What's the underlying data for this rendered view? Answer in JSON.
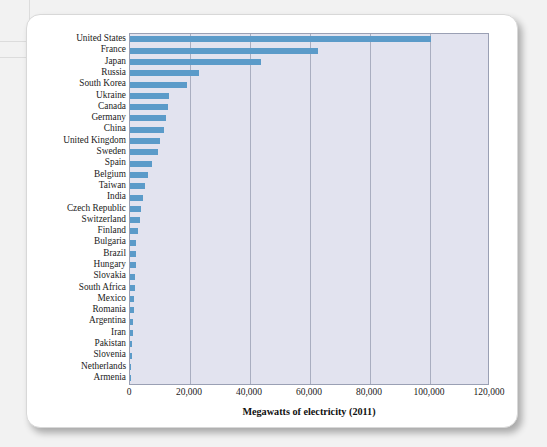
{
  "figure": {
    "background_color": "#f2f2f2",
    "card_color": "#ffffff",
    "plot_background": "#e2e3ef",
    "bar_color": "#5b9bc9",
    "gridline_color": "#a9aec0"
  },
  "chart_data": {
    "type": "bar",
    "orientation": "horizontal",
    "title": "",
    "subtitle": "",
    "xlabel": "Megawatts of electricity (2011)",
    "ylabel": "",
    "xlim": [
      0,
      120000
    ],
    "xticks": [
      0,
      20000,
      40000,
      60000,
      80000,
      100000,
      120000
    ],
    "xtick_labels": [
      "0",
      "20,000",
      "40,000",
      "60,000",
      "80,000",
      "100,000",
      "120,000"
    ],
    "grid": true,
    "grid_axis": "x",
    "legend": null,
    "legend_position": "none",
    "categories": [
      "United States",
      "France",
      "Japan",
      "Russia",
      "South Korea",
      "Ukraine",
      "Canada",
      "Germany",
      "China",
      "United Kingdom",
      "Sweden",
      "Spain",
      "Belgium",
      "Taiwan",
      "India",
      "Czech Republic",
      "Switzerland",
      "Finland",
      "Bulgaria",
      "Brazil",
      "Hungary",
      "Slovakia",
      "South Africa",
      "Mexico",
      "Romania",
      "Argentina",
      "Iran",
      "Pakistan",
      "Slovenia",
      "Netherlands",
      "Armenia"
    ],
    "values": [
      101000,
      63000,
      44000,
      23000,
      19000,
      13100,
      12600,
      12000,
      11300,
      10000,
      9300,
      7500,
      6000,
      5000,
      4400,
      3800,
      3300,
      2700,
      2000,
      1900,
      1900,
      1800,
      1800,
      1400,
      1300,
      940,
      920,
      730,
      690,
      480,
      380
    ]
  }
}
